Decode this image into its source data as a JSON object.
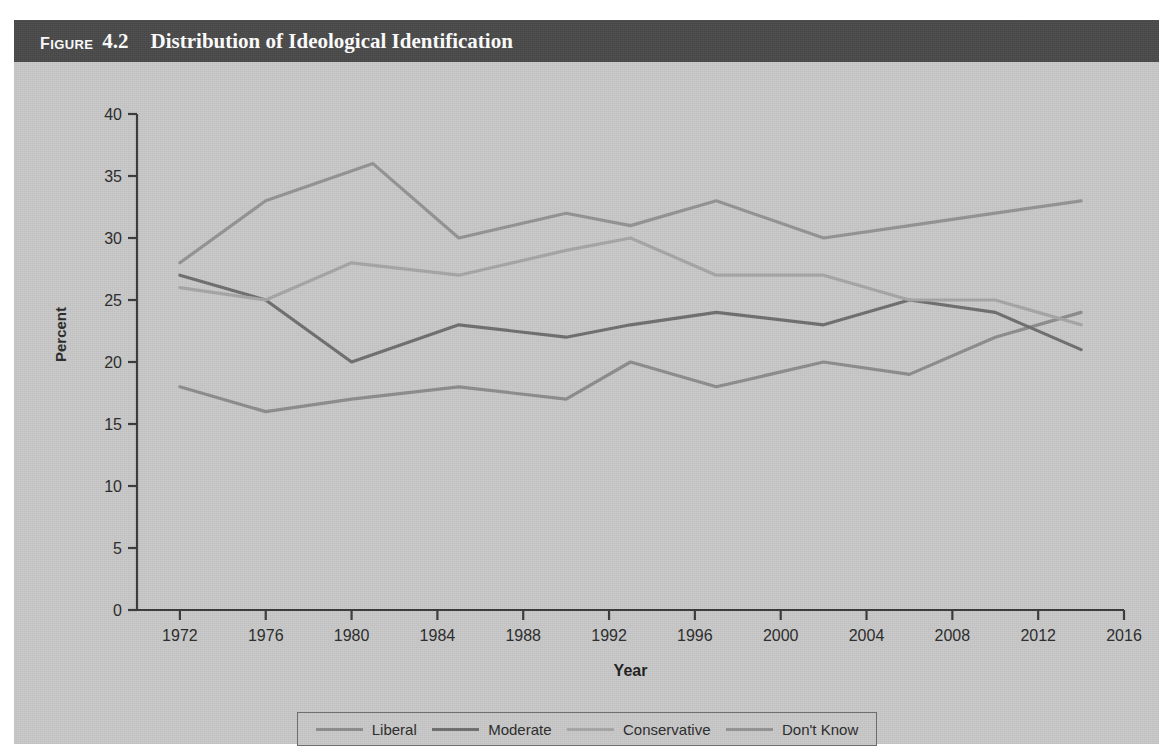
{
  "figure": {
    "label": "Figure",
    "number": "4.2",
    "title": "Distribution of Ideological Identification"
  },
  "colors": {
    "header_bar": "#4a4a4a",
    "panel_bg": "#c9c9c9",
    "axis": "#3a3a3a",
    "liberal": "#8d8d8d",
    "moderate": "#6f6f6f",
    "conservative": "#a6a6a6",
    "dont_know": "#949494"
  },
  "chart_data": {
    "type": "line",
    "title": "Distribution of Ideological Identification",
    "xlabel": "Year",
    "ylabel": "Percent",
    "xlim": [
      1970,
      2016
    ],
    "ylim": [
      0,
      40
    ],
    "xticks": [
      1972,
      1976,
      1980,
      1984,
      1988,
      1992,
      1996,
      2000,
      2004,
      2008,
      2012,
      2016
    ],
    "yticks": [
      0,
      5,
      10,
      15,
      20,
      25,
      30,
      35,
      40
    ],
    "grid": false,
    "legend_position": "bottom",
    "series": [
      {
        "name": "Liberal",
        "color": "#8d8d8d",
        "points": [
          [
            1972,
            18
          ],
          [
            1976,
            16
          ],
          [
            1980,
            17
          ],
          [
            1985,
            18
          ],
          [
            1990,
            17
          ],
          [
            1993,
            20
          ],
          [
            1997,
            18
          ],
          [
            2002,
            20
          ],
          [
            2006,
            19
          ],
          [
            2010,
            22
          ],
          [
            2014,
            24
          ]
        ]
      },
      {
        "name": "Moderate",
        "color": "#6f6f6f",
        "points": [
          [
            1972,
            27
          ],
          [
            1976,
            25
          ],
          [
            1980,
            20
          ],
          [
            1985,
            23
          ],
          [
            1990,
            22
          ],
          [
            1993,
            23
          ],
          [
            1997,
            24
          ],
          [
            2002,
            23
          ],
          [
            2006,
            25
          ],
          [
            2010,
            24
          ],
          [
            2014,
            21
          ]
        ]
      },
      {
        "name": "Conservative",
        "color": "#a6a6a6",
        "points": [
          [
            1972,
            26
          ],
          [
            1976,
            25
          ],
          [
            1980,
            28
          ],
          [
            1985,
            27
          ],
          [
            1990,
            29
          ],
          [
            1993,
            30
          ],
          [
            1997,
            27
          ],
          [
            2002,
            27
          ],
          [
            2006,
            25
          ],
          [
            2010,
            25
          ],
          [
            2014,
            23
          ]
        ]
      },
      {
        "name": "Don't Know",
        "color": "#949494",
        "points": [
          [
            1972,
            28
          ],
          [
            1976,
            33
          ],
          [
            1981,
            36
          ],
          [
            1985,
            30
          ],
          [
            1990,
            32
          ],
          [
            1993,
            31
          ],
          [
            1997,
            33
          ],
          [
            2002,
            30
          ],
          [
            2006,
            31
          ],
          [
            2010,
            32
          ],
          [
            2014,
            33
          ]
        ]
      }
    ]
  },
  "legend": {
    "items": [
      {
        "label": "Liberal",
        "color": "#8d8d8d"
      },
      {
        "label": "Moderate",
        "color": "#6f6f6f"
      },
      {
        "label": "Conservative",
        "color": "#a6a6a6"
      },
      {
        "label": "Don't Know",
        "color": "#949494"
      }
    ]
  }
}
